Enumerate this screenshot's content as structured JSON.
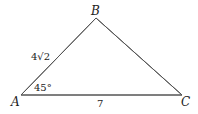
{
  "diagram": {
    "type": "triangle",
    "vertices": [
      {
        "name": "A",
        "label": "A"
      },
      {
        "name": "B",
        "label": "B"
      },
      {
        "name": "C",
        "label": "C"
      }
    ],
    "sides": {
      "AB": {
        "label": "4√2"
      },
      "AC": {
        "label": "7"
      }
    },
    "angles": {
      "A": {
        "label": "45°"
      }
    },
    "colors": {
      "line": "#555555",
      "text": "#222222"
    }
  }
}
